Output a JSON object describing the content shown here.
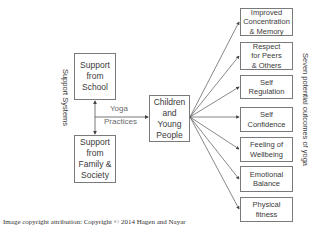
{
  "diagram": {
    "left_label": "Support Systems",
    "right_label": "Seven potential outcomes of yoga",
    "supports": [
      {
        "id": "school",
        "label": "Support\nfrom\nSchool"
      },
      {
        "id": "family",
        "label": "Support\nfrom\nFamily &\nSociety"
      }
    ],
    "edge_label_line1": "Yoga",
    "edge_label_line2": "Practices",
    "center": {
      "label": "Children\nand\nYoung\nPeople"
    },
    "outcomes": [
      {
        "label": "Improved\nConcentration\n& Memory"
      },
      {
        "label": "Respect\nfor Peers\n& Others"
      },
      {
        "label": "Self\nRegulation"
      },
      {
        "label": "Self\nConfidence"
      },
      {
        "label": "Feeling of\nWellbeing"
      },
      {
        "label": "Emotional\nBalance"
      },
      {
        "label": "Physical\nfitness"
      }
    ],
    "line_color": "#555555",
    "border_color": "#7a7a7a"
  },
  "footer": {
    "attribution": "Image copyright attribution: Copyright © 2014 Hagen and Nayar"
  }
}
